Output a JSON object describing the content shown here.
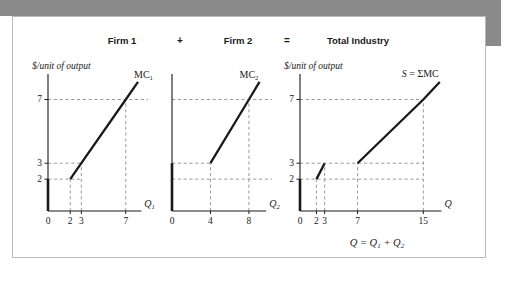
{
  "figure": {
    "headers": [
      {
        "text": "Firm 1",
        "kind": "panel"
      },
      {
        "text": "+",
        "kind": "operator"
      },
      {
        "text": "Firm 2",
        "kind": "panel"
      },
      {
        "text": "=",
        "kind": "operator"
      },
      {
        "text": "Total Industry",
        "kind": "panel"
      }
    ],
    "caption": "Q = Q₁ + Q₂",
    "colors": {
      "curve": "#1a1a1a",
      "axis": "#1a1a1a",
      "dashed_guide": "#8f8f8f",
      "shadow_band": "#8a8a8a",
      "card_border": "#b9b9b9",
      "background": "#ffffff"
    }
  },
  "chart_data": [
    {
      "type": "line",
      "title": "Firm 1",
      "ylabel": "$/unit of output",
      "xlabel": "Q₁",
      "curve_label": "MC₁",
      "xlim": [
        0,
        9
      ],
      "ylim": [
        0,
        8.6
      ],
      "grid": false,
      "xticks": [
        0,
        2,
        3,
        7
      ],
      "yticks": [
        2,
        3,
        7
      ],
      "xtick_labels": [
        "0",
        "2",
        "3",
        "7"
      ],
      "ytick_labels": [
        "2",
        "3",
        "7"
      ],
      "series": [
        {
          "name": "MC1",
          "points": [
            [
              2,
              2
            ],
            [
              3,
              3
            ],
            [
              7,
              7
            ],
            [
              8.1,
              8.1
            ]
          ]
        }
      ],
      "axis_segment": {
        "x": 0,
        "y_from": 0,
        "y_to": 2
      },
      "guides": [
        {
          "orient": "h",
          "value": 2,
          "from": 0,
          "to": 3
        },
        {
          "orient": "h",
          "value": 3,
          "from": 0,
          "to": 3
        },
        {
          "orient": "h",
          "value": 7,
          "from": 0,
          "to": 9
        },
        {
          "orient": "v",
          "value": 2,
          "from": 0,
          "to": 2
        },
        {
          "orient": "v",
          "value": 3,
          "from": 0,
          "to": 3
        },
        {
          "orient": "v",
          "value": 7,
          "from": 0,
          "to": 7
        }
      ]
    },
    {
      "type": "line",
      "title": "Firm 2",
      "ylabel": "",
      "xlabel": "Q₂",
      "curve_label": "MC₂",
      "xlim": [
        0,
        10.4
      ],
      "ylim": [
        0,
        8.6
      ],
      "grid": false,
      "xticks": [
        0,
        4,
        8
      ],
      "yticks": [
        2,
        3,
        7
      ],
      "xtick_labels": [
        "0",
        "4",
        "8"
      ],
      "ytick_labels": [
        "",
        "",
        ""
      ],
      "series": [
        {
          "name": "MC2",
          "points": [
            [
              4,
              3
            ],
            [
              8,
              7
            ],
            [
              9.1,
              8.1
            ]
          ]
        }
      ],
      "axis_segment": {
        "x": 0,
        "y_from": 0,
        "y_to": 3
      },
      "guides": [
        {
          "orient": "h",
          "value": 2,
          "from": 0,
          "to": 10.4
        },
        {
          "orient": "h",
          "value": 3,
          "from": 0,
          "to": 4
        },
        {
          "orient": "h",
          "value": 7,
          "from": 0,
          "to": 10.4
        },
        {
          "orient": "v",
          "value": 4,
          "from": 0,
          "to": 3
        },
        {
          "orient": "v",
          "value": 8,
          "from": 0,
          "to": 7
        }
      ]
    },
    {
      "type": "line",
      "title": "Total Industry",
      "ylabel": "$/unit of output",
      "xlabel": "Q",
      "curve_label": "S = ΣMC",
      "xlim": [
        0,
        18
      ],
      "ylim": [
        0,
        8.6
      ],
      "grid": false,
      "xticks": [
        0,
        2,
        3,
        7,
        15
      ],
      "yticks": [
        2,
        3,
        7
      ],
      "xtick_labels": [
        "0",
        "2",
        "3",
        "7",
        "15"
      ],
      "ytick_labels": [
        "2",
        "3",
        "7"
      ],
      "series": [
        {
          "name": "S_lower_kink",
          "points": [
            [
              2,
              2
            ],
            [
              3,
              3
            ]
          ]
        },
        {
          "name": "S_upper",
          "points": [
            [
              7,
              3
            ],
            [
              15,
              7
            ],
            [
              17,
              8.1
            ]
          ]
        }
      ],
      "axis_segment": {
        "x": 0,
        "y_from": 0,
        "y_to": 2
      },
      "guides": [
        {
          "orient": "h",
          "value": 2,
          "from": 0,
          "to": 15
        },
        {
          "orient": "h",
          "value": 3,
          "from": 0,
          "to": 15
        },
        {
          "orient": "h",
          "value": 7,
          "from": 0,
          "to": 15
        },
        {
          "orient": "v",
          "value": 2,
          "from": 0,
          "to": 2
        },
        {
          "orient": "v",
          "value": 3,
          "from": 0,
          "to": 3
        },
        {
          "orient": "v",
          "value": 7,
          "from": 0,
          "to": 3
        },
        {
          "orient": "v",
          "value": 15,
          "from": 0,
          "to": 7
        }
      ]
    }
  ]
}
